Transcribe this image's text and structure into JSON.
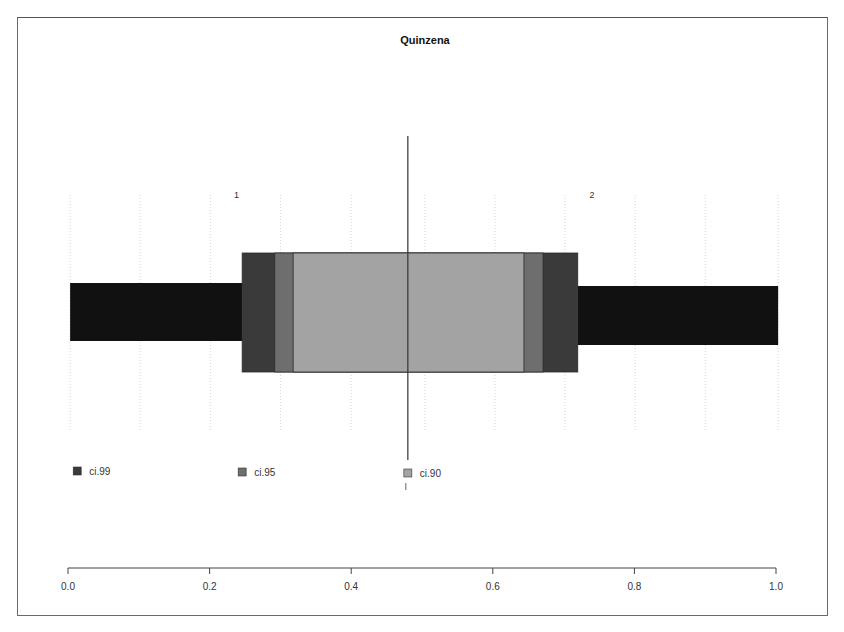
{
  "chart_data": {
    "type": "bar",
    "subtype": "horizontal-interval-bars",
    "title": "Quinzena",
    "xlabel": "",
    "ylabel": "",
    "xlim": [
      0.0,
      1.0
    ],
    "x_ticks": [
      0.0,
      0.2,
      0.4,
      0.6,
      0.8,
      1.0
    ],
    "x_tick_labels": [
      "0.0",
      "0.2",
      "0.4",
      "0.6",
      "0.8",
      "1.0"
    ],
    "grid": true,
    "grid_x": [
      0.003,
      0.102,
      0.201,
      0.3,
      0.4,
      0.504,
      0.603,
      0.702,
      0.801,
      0.9,
      1.003
    ],
    "group_labels": [
      {
        "label": "1",
        "x": 0.238
      },
      {
        "label": "2",
        "x": 0.74
      }
    ],
    "bars": [
      {
        "name": "group-1",
        "start": 0.003,
        "end": 0.246,
        "color": "#111111"
      },
      {
        "name": "group-2",
        "start": 0.72,
        "end": 1.003,
        "color": "#111111"
      }
    ],
    "center_line": 0.48,
    "intervals": [
      {
        "name": "ci.99",
        "lower": 0.246,
        "upper": 0.72,
        "color": "#3a3a3a"
      },
      {
        "name": "ci.95",
        "lower": 0.292,
        "upper": 0.671,
        "color": "#6e6e6e"
      },
      {
        "name": "ci.90",
        "lower": 0.318,
        "upper": 0.644,
        "color": "#a3a3a3"
      }
    ],
    "legend": [
      {
        "label": "ci.99",
        "color": "#3a3a3a",
        "x": 0.013
      },
      {
        "label": "ci.95",
        "color": "#6e6e6e",
        "x": 0.246
      },
      {
        "label": "ci.90",
        "color": "#a3a3a3",
        "x": 0.48
      }
    ],
    "legend_position": "below-plot"
  }
}
